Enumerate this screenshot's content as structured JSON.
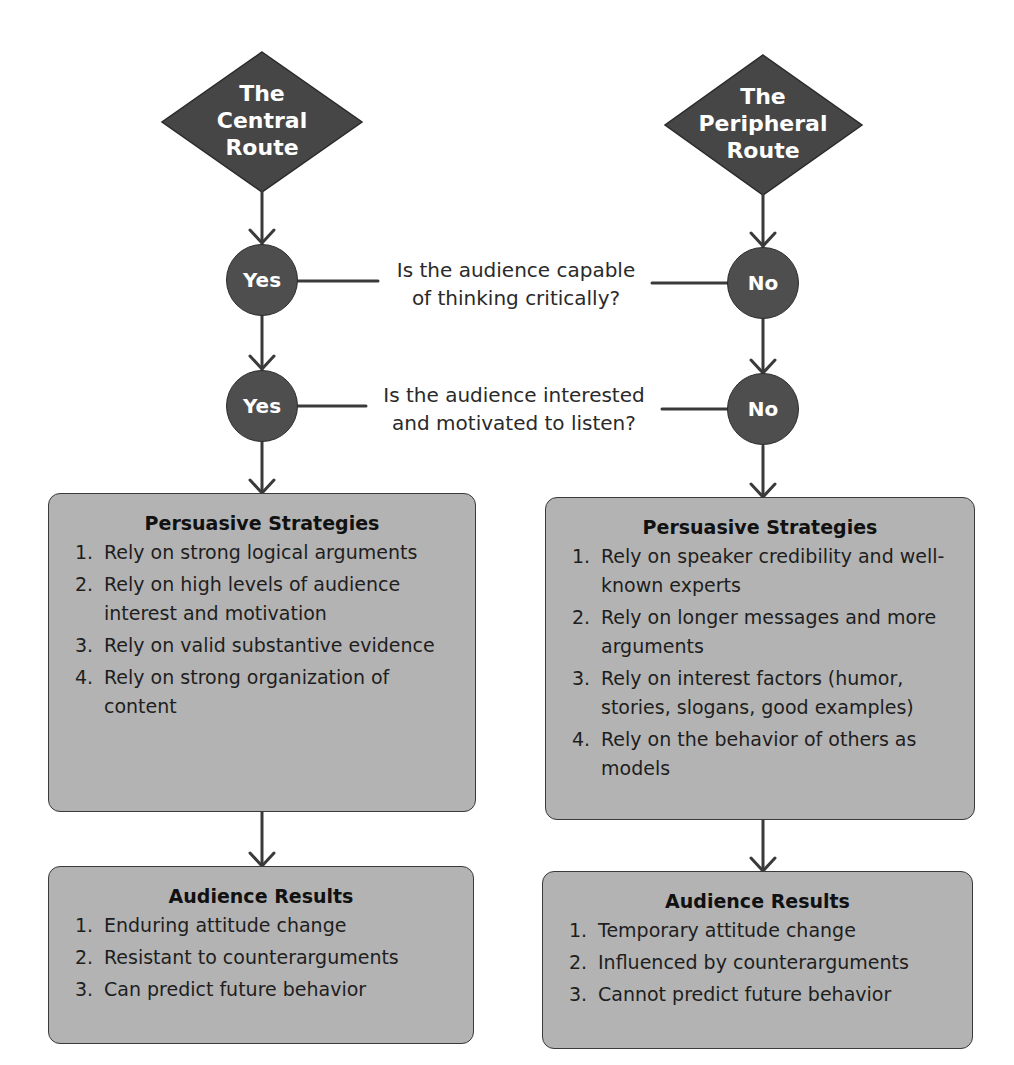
{
  "central_route": {
    "title_lines": [
      "The",
      "Central",
      "Route"
    ],
    "answer_1": "Yes",
    "answer_2": "Yes",
    "strategies": {
      "title": "Persuasive Strategies",
      "items": [
        {
          "num": "1.",
          "text": "Rely on strong logical arguments"
        },
        {
          "num": "2.",
          "text": "Rely on high levels of audience interest and motivation"
        },
        {
          "num": "3.",
          "text": "Rely on valid substantive evidence"
        },
        {
          "num": "4.",
          "text": "Rely on strong organization of content"
        }
      ]
    },
    "results": {
      "title": "Audience Results",
      "items": [
        {
          "num": "1.",
          "text": "Enduring attitude change"
        },
        {
          "num": "2.",
          "text": "Resistant to counterarguments"
        },
        {
          "num": "3.",
          "text": "Can predict future behavior"
        }
      ]
    }
  },
  "peripheral_route": {
    "title_lines": [
      "The",
      "Peripheral",
      "Route"
    ],
    "answer_1": "No",
    "answer_2": "No",
    "strategies": {
      "title": "Persuasive Strategies",
      "items": [
        {
          "num": "1.",
          "text": "Rely on speaker credibility and well-known experts"
        },
        {
          "num": "2.",
          "text": "Rely on longer messages and more arguments"
        },
        {
          "num": "3.",
          "text": "Rely on interest factors (humor, stories, slogans, good examples)"
        },
        {
          "num": "4.",
          "text": "Rely on the behavior of others as models"
        }
      ]
    },
    "results": {
      "title": "Audience Results",
      "items": [
        {
          "num": "1.",
          "text": "Temporary attitude change"
        },
        {
          "num": "2.",
          "text": "Influenced by counterarguments"
        },
        {
          "num": "3.",
          "text": "Cannot predict future behavior"
        }
      ]
    }
  },
  "questions": {
    "q1_lines": [
      "Is the audience capable",
      "of thinking critically?"
    ],
    "q2_lines": [
      "Is the audience interested",
      "and motivated to listen?"
    ]
  },
  "colors": {
    "node_fill": "#4e4e4e",
    "box_fill": "#b3b3b3",
    "line": "#3a3a3a"
  }
}
